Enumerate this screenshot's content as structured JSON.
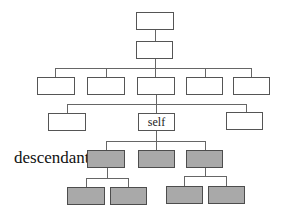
{
  "diagram": {
    "type": "tree",
    "self_label": "self",
    "descendant_label": "descendant",
    "colors": {
      "node_fill": "#ffffff",
      "descendant_fill": "#a9a9a9",
      "border": "#555555",
      "edge": "#666666"
    },
    "levels": [
      {
        "level": 0,
        "nodes": 1
      },
      {
        "level": 1,
        "nodes": 1
      },
      {
        "level": 2,
        "nodes": 5
      },
      {
        "level": 3,
        "nodes": 3,
        "self_index": 1
      },
      {
        "level": 4,
        "nodes": 3,
        "descendant": true
      },
      {
        "level": 5,
        "nodes": 4,
        "descendant": true
      }
    ]
  }
}
